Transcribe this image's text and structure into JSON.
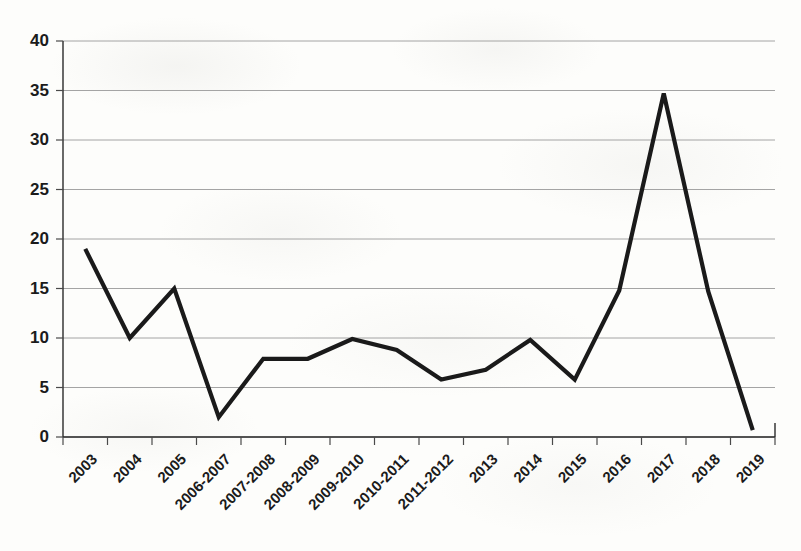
{
  "chart_data": {
    "type": "line",
    "title": "",
    "subtitle": "",
    "xlabel": "",
    "ylabel": "",
    "categories": [
      "2003",
      "2004",
      "2005",
      "2006-2007",
      "2007-2008",
      "2008-2009",
      "2009-2010",
      "2010-2011",
      "2011-2012",
      "2013",
      "2014",
      "2015",
      "2016",
      "2017",
      "2018",
      "2019"
    ],
    "values": [
      19.0,
      10.0,
      15.0,
      2.0,
      7.9,
      7.9,
      9.9,
      8.8,
      5.8,
      6.8,
      9.8,
      5.8,
      14.8,
      34.7,
      14.7,
      0.7
    ],
    "series": [
      {
        "name": "series-1",
        "values": [
          19.0,
          10.0,
          15.0,
          2.0,
          7.9,
          7.9,
          9.9,
          8.8,
          5.8,
          6.8,
          9.8,
          5.8,
          14.8,
          34.7,
          14.7,
          0.7
        ],
        "color": "#1a1a1a"
      }
    ],
    "ylim": [
      0,
      40
    ],
    "yticks": [
      0,
      5,
      10,
      15,
      20,
      25,
      30,
      35,
      40
    ],
    "ytick_labels": [
      "0",
      "5",
      "10",
      "15",
      "20",
      "25",
      "30",
      "35",
      "40"
    ],
    "grid": true,
    "grid_axis": "y",
    "legend": false,
    "legend_position": "none",
    "xtick_label_rotation": 45,
    "colors": {
      "line": "#1a1a1a",
      "grid": "#9a9a9a",
      "axis": "#2a2a2a",
      "text": "#1b1b1b",
      "background": "#fdfdfb"
    }
  },
  "annotations": {
    "peak_year": "2017",
    "peak_value": "34.7",
    "min_year": "2019",
    "min_value": "0.7"
  }
}
